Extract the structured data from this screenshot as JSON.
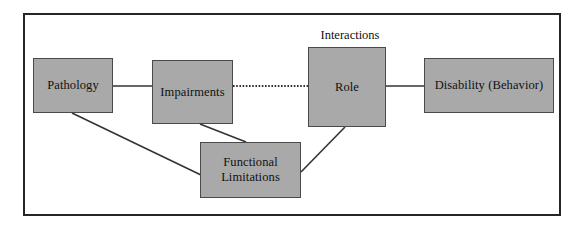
{
  "figure": {
    "background_color": "#ffffff",
    "frame_color": "#262626",
    "node_fill_color": "#a9a9a9",
    "node_border_color": "#4a4a4a",
    "ellipse_fill_color": "#ffffff",
    "connector_color": "#333333"
  },
  "nodes": {
    "pathology": {
      "label": "Pathology"
    },
    "impairments": {
      "label": "Impairments"
    },
    "functional_limitations": {
      "line1": "Functional",
      "line2": "Limitations"
    },
    "role": {
      "label": "Role"
    },
    "disability": {
      "label": "Disability (Behavior)"
    }
  },
  "annotations": {
    "interactions": {
      "label": "Interactions"
    }
  },
  "connectors": [
    {
      "name": "pathology-to-impairments",
      "style": "solid",
      "from": "pathology",
      "to": "impairments"
    },
    {
      "name": "impairments-to-role",
      "style": "dotted",
      "from": "impairments",
      "to": "role"
    },
    {
      "name": "role-to-disability",
      "style": "solid",
      "from": "role",
      "to": "disability"
    },
    {
      "name": "pathology-to-functional-limitations",
      "style": "solid",
      "from": "pathology",
      "to": "functional_limitations"
    },
    {
      "name": "impairments-to-functional-limitations",
      "style": "solid",
      "from": "impairments",
      "to": "functional_limitations"
    },
    {
      "name": "functional-limitations-to-role",
      "style": "solid",
      "from": "functional_limitations",
      "to": "role"
    }
  ]
}
